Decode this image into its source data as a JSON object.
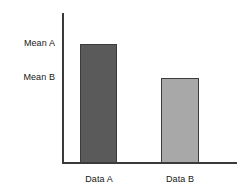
{
  "chart_data": {
    "type": "bar",
    "title": "",
    "subtitle": "",
    "xlabel": "",
    "ylabel": "",
    "categories": [
      "Data A",
      "Data B"
    ],
    "values": [
      100,
      71
    ],
    "value_labels": [
      "Mean A",
      "Mean B"
    ],
    "series": [
      {
        "name": "Means",
        "values": [
          100,
          71
        ]
      }
    ],
    "ylim": [
      0,
      126
    ],
    "grid": false,
    "legend": false,
    "legend_position": "none",
    "annotations": [],
    "bar_colors": [
      "#5a5a5a",
      "#a8a8a8"
    ],
    "bar_edge_color": "#3c3c3c",
    "axis_color": "#3a3a3a",
    "background_color": "#ffffff",
    "text_color": "#171717"
  },
  "axes": {
    "y_axis_name": "y-axis-line",
    "x_axis_name": "x-axis-line",
    "y_tick_labels": [
      "Mean A",
      "Mean B"
    ],
    "x_tick_labels": [
      "Data A",
      "Data B"
    ]
  },
  "bars": [
    {
      "id": "bar-a",
      "category": "Data A",
      "mean_label": "Mean A",
      "color": "#5a5a5a",
      "value": 100
    },
    {
      "id": "bar-b",
      "category": "Data B",
      "mean_label": "Mean B",
      "color": "#a8a8a8",
      "value": 71
    }
  ]
}
